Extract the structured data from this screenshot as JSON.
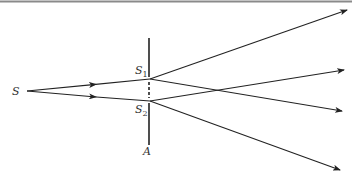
{
  "diagram": {
    "labels": {
      "source": "S",
      "slit1": "S",
      "slit1_sub": "1",
      "slit2": "S",
      "slit2_sub": "2",
      "barrier": "A"
    },
    "colors": {
      "line": "#222222",
      "border": "#888888",
      "background": "#ffffff"
    },
    "geometry": {
      "source": [
        27,
        91
      ],
      "slit1": [
        150,
        79
      ],
      "slit2": [
        150,
        101
      ],
      "barrier_x": 149,
      "barrier_y": [
        38,
        145
      ],
      "rays_out": [
        {
          "from": "slit1",
          "to": [
            347,
            10
          ]
        },
        {
          "from": "slit1",
          "to": [
            342,
            111
          ]
        },
        {
          "from": "slit2",
          "to": [
            344,
            70
          ]
        },
        {
          "from": "slit2",
          "to": [
            340,
            170
          ]
        }
      ]
    }
  }
}
